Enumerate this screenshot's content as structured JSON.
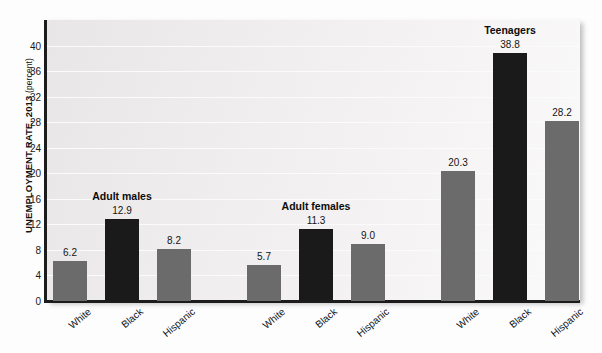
{
  "chart_data": {
    "type": "bar",
    "title": "",
    "xlabel": "",
    "ylabel": "UNEMPLOYMENT RATE, 2013",
    "ylabel_unit": "(percent)",
    "ylim": [
      0,
      44
    ],
    "yticks": [
      0,
      4,
      8,
      12,
      16,
      20,
      24,
      28,
      32,
      36,
      40
    ],
    "grid": true,
    "legend": "none",
    "categories": [
      "White",
      "Black",
      "Hispanic",
      "White",
      "Black",
      "Hispanic",
      "White",
      "Black",
      "Hispanic",
      "National average"
    ],
    "values": [
      6.2,
      12.9,
      8.2,
      5.7,
      11.3,
      9.0,
      20.3,
      38.8,
      28.2,
      7.4
    ],
    "groups": [
      {
        "name": "Adult males",
        "bars": [
          {
            "label": "White",
            "value": 6.2,
            "color": "#6b6b6b",
            "style": "gray"
          },
          {
            "label": "Black",
            "value": 12.9,
            "color": "#1a1a1a",
            "style": "black"
          },
          {
            "label": "Hispanic",
            "value": 8.2,
            "color": "#6b6b6b",
            "style": "gray"
          }
        ]
      },
      {
        "name": "Adult females",
        "bars": [
          {
            "label": "White",
            "value": 5.7,
            "color": "#6b6b6b",
            "style": "gray"
          },
          {
            "label": "Black",
            "value": 11.3,
            "color": "#1a1a1a",
            "style": "black"
          },
          {
            "label": "Hispanic",
            "value": 9.0,
            "color": "#6b6b6b",
            "style": "gray"
          }
        ]
      },
      {
        "name": "Teenagers",
        "bars": [
          {
            "label": "White",
            "value": 20.3,
            "color": "#6b6b6b",
            "style": "gray"
          },
          {
            "label": "Black",
            "value": 38.8,
            "color": "#1a1a1a",
            "style": "black"
          },
          {
            "label": "Hispanic",
            "value": 28.2,
            "color": "#6b6b6b",
            "style": "gray"
          }
        ]
      },
      {
        "name": "",
        "bars": [
          {
            "label": "National average",
            "label_line1": "National",
            "label_line2": "average",
            "value": 7.4,
            "color": "#1a1a1a",
            "style": "black",
            "bold_label": true
          }
        ]
      }
    ],
    "colors": {
      "gray_bar": "#6b6b6b",
      "black_bar": "#1a1a1a",
      "plot_background": "#eeecec",
      "gridline": "#fbfbfb",
      "axis": "#1c1c1c",
      "text": "#111111"
    }
  },
  "axis_labels": {
    "y_title_main": "UNEMPLOYMENT RATE, 2013 ",
    "y_title_unit": "(percent)"
  }
}
